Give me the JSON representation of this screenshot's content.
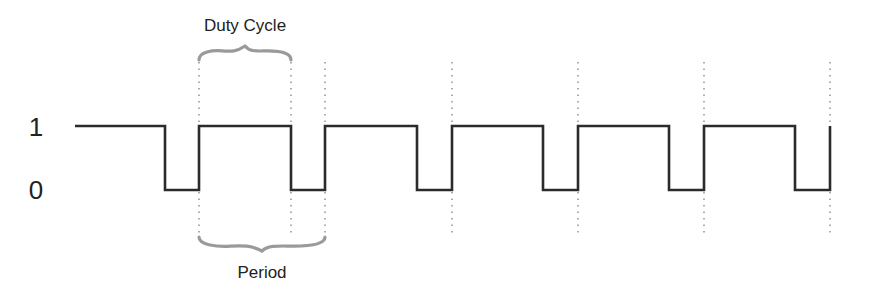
{
  "diagram": {
    "levels": [
      {
        "label": "1",
        "y": 126
      },
      {
        "label": "0",
        "y": 190
      }
    ],
    "annotations": {
      "duty_cycle": {
        "label": "Duty Cycle",
        "x_start": 199,
        "x_end": 291
      },
      "period": {
        "label": "Period",
        "x_start": 199,
        "x_end": 325
      }
    },
    "waveform": {
      "start_x": 75,
      "end_x": 830,
      "initial_level": 1,
      "transitions": [
        {
          "x": 165,
          "to": 0
        },
        {
          "x": 199,
          "to": 1
        },
        {
          "x": 291,
          "to": 0
        },
        {
          "x": 325,
          "to": 1
        },
        {
          "x": 417,
          "to": 0
        },
        {
          "x": 452,
          "to": 1
        },
        {
          "x": 543,
          "to": 0
        },
        {
          "x": 578,
          "to": 1
        },
        {
          "x": 669,
          "to": 0
        },
        {
          "x": 704,
          "to": 1
        },
        {
          "x": 795,
          "to": 0
        },
        {
          "x": 830,
          "to": 1
        }
      ]
    },
    "guide_lines_x": [
      199,
      291,
      325,
      452,
      578,
      704,
      830
    ],
    "colors": {
      "waveform": "#2b2b2b",
      "guides": "#8a8a8a",
      "braces": "#9a9a9a",
      "text": "#222222"
    }
  }
}
